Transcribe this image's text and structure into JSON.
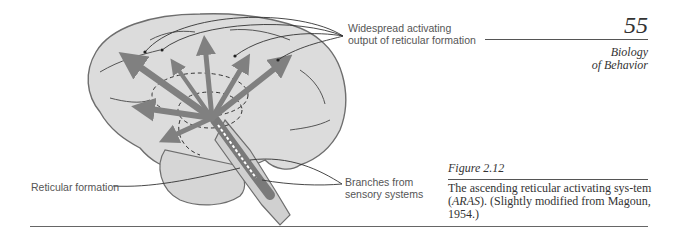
{
  "page": {
    "number": "55",
    "running_head_line1": "Biology",
    "running_head_line2": "of Behavior"
  },
  "figure": {
    "label": "Figure 2.12",
    "caption_part1": "The ascending reticular activating sys-tem (",
    "caption_abbrev": "ARAS",
    "caption_part2": "). (Slightly modified from Magoun, 1954.)",
    "annotations": {
      "widespread": "Widespread activating output of reticular formation",
      "branches": "Branches from sensory systems",
      "reticular": "Reticular formation"
    },
    "colors": {
      "brain_fill": "#dcdcdc",
      "brain_outline": "#6e6e6e",
      "arrow": "#808080",
      "leader_line": "#333333"
    }
  }
}
